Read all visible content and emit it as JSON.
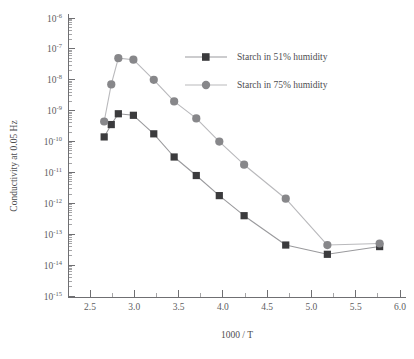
{
  "chart_data": {
    "type": "scatter",
    "title": "",
    "xlabel": "1000 / T",
    "ylabel": "Conductivity at 0.05 Hz",
    "xlim": [
      2.5,
      6.0
    ],
    "ylim_log10": [
      -15,
      -6
    ],
    "xticks": [
      "2.5",
      "3.0",
      "3.5",
      "4.0",
      "4.5",
      "5.0",
      "5.5",
      "6.0"
    ],
    "yticks": [
      "10-6",
      "10-7",
      "10-8",
      "10-9",
      "10-10",
      "10-11",
      "10-12",
      "10-13",
      "10-14",
      "10-15"
    ],
    "ytick_mantissa": "10",
    "ytick_exponents": [
      "-6",
      "-7",
      "-8",
      "-9",
      "-10",
      "-11",
      "-12",
      "-13",
      "-14",
      "-15"
    ],
    "grid": false,
    "legend_position": "upper-right",
    "series": [
      {
        "name": "Starch in 51% humidity",
        "marker": "square",
        "color": "#3b3b3d",
        "line_color": "#9a9a9d",
        "points": [
          {
            "x": 2.66,
            "y_log10": -9.85
          },
          {
            "x": 2.74,
            "y_log10": -9.45
          },
          {
            "x": 2.82,
            "y_log10": -9.1
          },
          {
            "x": 2.99,
            "y_log10": -9.15
          },
          {
            "x": 3.22,
            "y_log10": -9.75
          },
          {
            "x": 3.45,
            "y_log10": -10.5
          },
          {
            "x": 3.7,
            "y_log10": -11.1
          },
          {
            "x": 3.96,
            "y_log10": -11.75
          },
          {
            "x": 4.24,
            "y_log10": -12.4
          },
          {
            "x": 4.71,
            "y_log10": -13.35
          },
          {
            "x": 5.18,
            "y_log10": -13.65
          },
          {
            "x": 5.77,
            "y_log10": -13.4
          }
        ]
      },
      {
        "name": "Starch in 75% humidity",
        "marker": "circle",
        "color": "#87878a",
        "line_color": "#b9b9bc",
        "points": [
          {
            "x": 2.66,
            "y_log10": -9.35
          },
          {
            "x": 2.74,
            "y_log10": -8.15
          },
          {
            "x": 2.82,
            "y_log10": -7.3
          },
          {
            "x": 2.99,
            "y_log10": -7.35
          },
          {
            "x": 3.22,
            "y_log10": -8.0
          },
          {
            "x": 3.45,
            "y_log10": -8.7
          },
          {
            "x": 3.7,
            "y_log10": -9.25
          },
          {
            "x": 3.96,
            "y_log10": -10.0
          },
          {
            "x": 4.24,
            "y_log10": -10.75
          },
          {
            "x": 4.71,
            "y_log10": -11.85
          },
          {
            "x": 5.18,
            "y_log10": -13.35
          },
          {
            "x": 5.77,
            "y_log10": -13.3
          }
        ]
      }
    ]
  },
  "legend": {
    "entries": [
      {
        "label": "Starch in 51% humidity",
        "marker": "square",
        "color": "#3b3b3d",
        "line_color": "#9a9a9d"
      },
      {
        "label": "Starch in 75% humidity",
        "marker": "circle",
        "color": "#87878a",
        "line_color": "#b9b9bc"
      }
    ]
  },
  "axes": {
    "x_title": "1000 / T",
    "y_title": "Conductivity at 0.05 Hz"
  }
}
